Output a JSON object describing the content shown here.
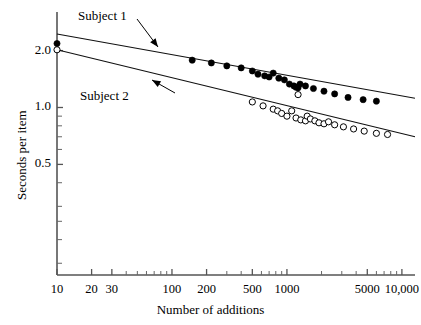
{
  "chart_data": {
    "type": "scatter",
    "title": "",
    "xlabel": "Number of additions",
    "ylabel": "Seconds per item",
    "xscale": "log",
    "yscale": "log",
    "xlim": [
      10,
      13000
    ],
    "ylim": [
      0.13,
      3.2
    ],
    "grid": false,
    "legend_position": "inline-annotations",
    "annotations": [
      {
        "text": "Subject 1",
        "points_to": "upper-fitted-line"
      },
      {
        "text": "Subject 2",
        "points_to": "lower-fitted-line"
      }
    ],
    "x_ticks_labeled": [
      10,
      20,
      30,
      100,
      200,
      500,
      1000,
      5000,
      10000
    ],
    "x_tick_labels": [
      "10",
      "20",
      "30",
      "100",
      "200",
      "500",
      "1000",
      "5000",
      "10,000"
    ],
    "x_ticks_minor": [
      40,
      50,
      60,
      70,
      80,
      90,
      300,
      400,
      600,
      700,
      800,
      900,
      2000,
      3000,
      4000,
      6000,
      7000,
      8000,
      9000
    ],
    "y_ticks_labeled": [
      2.0,
      1.0,
      0.5
    ],
    "y_tick_labels": [
      "2.0",
      "1.0",
      "0.5"
    ],
    "y_ticks_minor": [
      0.9,
      0.8,
      0.7,
      0.6,
      0.4,
      0.3,
      0.25,
      0.2,
      0.15
    ],
    "series": [
      {
        "name": "Subject 1",
        "marker": "filled-circle",
        "color": "#000000",
        "points": [
          [
            10,
            2.18
          ],
          [
            150,
            1.78
          ],
          [
            220,
            1.72
          ],
          [
            300,
            1.66
          ],
          [
            400,
            1.62
          ],
          [
            500,
            1.56
          ],
          [
            560,
            1.5
          ],
          [
            640,
            1.47
          ],
          [
            700,
            1.45
          ],
          [
            760,
            1.52
          ],
          [
            850,
            1.43
          ],
          [
            950,
            1.4
          ],
          [
            1050,
            1.33
          ],
          [
            1150,
            1.3
          ],
          [
            1200,
            1.28
          ],
          [
            1250,
            1.27
          ],
          [
            1300,
            1.33
          ],
          [
            1450,
            1.3
          ],
          [
            1700,
            1.26
          ],
          [
            2100,
            1.22
          ],
          [
            2600,
            1.18
          ],
          [
            3400,
            1.13
          ],
          [
            4600,
            1.1
          ],
          [
            6000,
            1.08
          ]
        ],
        "fitted_line": {
          "x1": 10,
          "y1": 2.45,
          "x2": 13000,
          "y2": 1.12
        }
      },
      {
        "name": "Subject 2",
        "marker": "open-circle",
        "color": "#000000",
        "points": [
          [
            10,
            2.02
          ],
          [
            500,
            1.07
          ],
          [
            620,
            1.02
          ],
          [
            760,
            0.98
          ],
          [
            830,
            0.96
          ],
          [
            900,
            0.93
          ],
          [
            1000,
            0.9
          ],
          [
            1100,
            0.96
          ],
          [
            1200,
            0.88
          ],
          [
            1320,
            0.86
          ],
          [
            1450,
            0.85
          ],
          [
            1500,
            0.9
          ],
          [
            1600,
            0.87
          ],
          [
            1750,
            0.85
          ],
          [
            1900,
            0.83
          ],
          [
            2100,
            0.82
          ],
          [
            2300,
            0.84
          ],
          [
            2600,
            0.81
          ],
          [
            3100,
            0.79
          ],
          [
            3800,
            0.77
          ],
          [
            4700,
            0.75
          ],
          [
            6000,
            0.73
          ],
          [
            7500,
            0.72
          ]
        ],
        "fitted_line": {
          "x1": 10,
          "y1": 2.02,
          "x2": 13000,
          "y2": 0.7
        }
      },
      {
        "name": "Subject 2 outlier",
        "marker": "open-circle",
        "color": "#000000",
        "points": [
          [
            1250,
            1.17
          ]
        ]
      }
    ]
  },
  "axes": {
    "xlabel": "Number of additions",
    "ylabel": "Seconds per item"
  }
}
